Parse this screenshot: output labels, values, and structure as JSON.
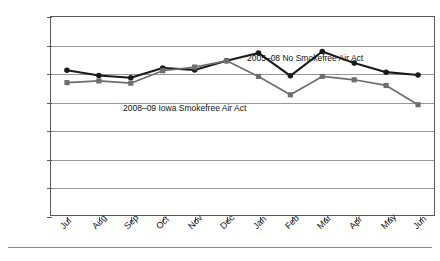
{
  "chart_data": {
    "type": "line",
    "title": "",
    "xlabel": "",
    "ylabel": "Number of Hospitalizations",
    "ylim": [
      0,
      700
    ],
    "ytick_values": [
      0,
      100,
      200,
      300,
      400,
      500,
      600,
      700
    ],
    "ytick_labels": [
      "0",
      "100",
      "200",
      "300",
      "400",
      "500",
      "600",
      "700"
    ],
    "grid": "horizontal",
    "legend": "none-inline-annotations",
    "categories": [
      "Jul",
      "Aug",
      "Sep",
      "Oct",
      "Nov",
      "Dec",
      "Jan",
      "Feb",
      "Mar",
      "Apr",
      "May",
      "Jun"
    ],
    "series": [
      {
        "name": "2005-08 No Smokefree Air Act",
        "color": "#1a1a1a",
        "marker": "circle",
        "values": [
          512,
          493,
          485,
          520,
          513,
          545,
          573,
          492,
          578,
          537,
          505,
          495
        ]
      },
      {
        "name": "2008-09 Iowa Smokefree Air Act",
        "color": "#6e6e6e",
        "marker": "square",
        "values": [
          468,
          474,
          466,
          510,
          523,
          545,
          490,
          425,
          490,
          478,
          458,
          390
        ]
      }
    ],
    "annotations": [
      {
        "text": "2005–08 No Smokefree Air Act",
        "anchor": "upper-middle"
      },
      {
        "text": "2008–09 Iowa Smokefree Air Act",
        "anchor": "lower-left"
      }
    ]
  },
  "footer": {
    "note": ""
  }
}
